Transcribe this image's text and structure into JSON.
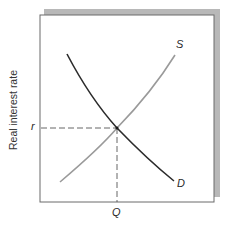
{
  "diagram": {
    "type": "supply-demand",
    "y_axis_label": "Real interest rate",
    "x_axis_label": "",
    "equilibrium_rate_label": "r",
    "equilibrium_quantity_label": "Q",
    "curves": [
      {
        "name": "supply",
        "label": "S",
        "shape": "upward-sloping, convex",
        "color": "#9a9a9a"
      },
      {
        "name": "demand",
        "label": "D",
        "shape": "downward-sloping, convex",
        "color": "#2b2b2b"
      }
    ],
    "guides": {
      "horizontal": "dashed line from r to equilibrium",
      "vertical": "dashed line from equilibrium to Q"
    },
    "colors": {
      "frame": "#6a6a6a",
      "shadow": "#b5b5b5",
      "guide": "#555555"
    }
  }
}
